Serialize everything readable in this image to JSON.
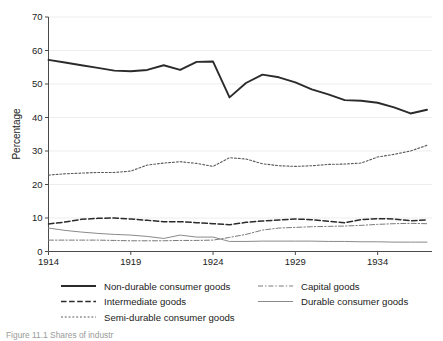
{
  "chart_data": {
    "type": "line",
    "title": "",
    "xlabel": "",
    "ylabel": "Percentage",
    "xlim": [
      1914,
      1937
    ],
    "ylim": [
      0,
      70
    ],
    "ytick_step": 10,
    "yticks": [
      0,
      10,
      20,
      30,
      40,
      50,
      60,
      70
    ],
    "xticks": [
      1914,
      1919,
      1924,
      1929,
      1934
    ],
    "grid": "horizontal",
    "legend_position": "below-plot",
    "x": [
      1914,
      1915,
      1916,
      1917,
      1918,
      1919,
      1920,
      1921,
      1922,
      1923,
      1924,
      1925,
      1926,
      1927,
      1928,
      1929,
      1930,
      1931,
      1932,
      1933,
      1934,
      1935,
      1936,
      1937
    ],
    "series": [
      {
        "name": "Non-durable consumer goods",
        "style": "solid",
        "width": 1.9,
        "color": "#2b2b2b",
        "values": [
          57.2,
          56.4,
          55.6,
          54.8,
          54.0,
          53.8,
          54.2,
          55.6,
          54.2,
          56.6,
          56.7,
          46.0,
          50.3,
          52.8,
          52.0,
          50.5,
          48.4,
          46.9,
          45.2,
          45.0,
          44.4,
          43.0,
          41.2,
          42.3
        ]
      },
      {
        "name": "Semi-durable consumer goods",
        "style": "dotted",
        "width": 1.1,
        "color": "#5a5a5a",
        "values": [
          22.8,
          23.2,
          23.4,
          23.6,
          23.6,
          24.0,
          25.8,
          26.4,
          26.8,
          26.3,
          25.4,
          28.0,
          27.6,
          26.2,
          25.6,
          25.4,
          25.6,
          26.0,
          26.1,
          26.4,
          28.2,
          29.0,
          30.0,
          31.7
        ]
      },
      {
        "name": "Intermediate goods",
        "style": "dashed",
        "width": 1.5,
        "color": "#2b2b2b",
        "values": [
          8.2,
          8.8,
          9.6,
          9.9,
          10.0,
          9.7,
          9.3,
          8.9,
          8.9,
          8.6,
          8.3,
          8.0,
          8.7,
          9.1,
          9.4,
          9.7,
          9.5,
          9.0,
          8.6,
          9.5,
          9.8,
          9.7,
          9.2,
          9.4
        ]
      },
      {
        "name": "Durable consumer goods",
        "style": "solid",
        "width": 1.0,
        "color": "#8a8a8a",
        "values": [
          7.0,
          6.3,
          5.8,
          5.4,
          5.1,
          4.9,
          4.5,
          3.9,
          4.9,
          4.3,
          4.3,
          3.0,
          3.0,
          3.1,
          3.1,
          3.1,
          3.1,
          3.0,
          3.0,
          2.9,
          2.9,
          2.8,
          2.8,
          2.8
        ]
      },
      {
        "name": "Capital goods",
        "style": "dashdot",
        "width": 1.0,
        "color": "#7a7a7a",
        "values": [
          3.4,
          3.4,
          3.4,
          3.4,
          3.3,
          3.2,
          3.2,
          3.2,
          3.3,
          3.3,
          3.4,
          4.2,
          5.1,
          6.4,
          7.0,
          7.2,
          7.4,
          7.5,
          7.6,
          7.8,
          8.1,
          8.3,
          8.4,
          8.3
        ]
      }
    ]
  },
  "axis": {
    "y_title": "Percentage",
    "y_tick_labels": [
      "0",
      "10",
      "20",
      "30",
      "40",
      "50",
      "60",
      "70"
    ],
    "x_tick_labels": [
      "1914",
      "1919",
      "1924",
      "1929",
      "1934"
    ]
  },
  "legend": {
    "column_left": [
      {
        "label": "Non-durable consumer goods",
        "style": "solid-thick"
      },
      {
        "label": "Intermediate goods",
        "style": "dashed"
      },
      {
        "label": "Semi-durable consumer goods",
        "style": "dotted"
      }
    ],
    "column_right": [
      {
        "label": "Capital goods",
        "style": "dashdot"
      },
      {
        "label": "Durable consumer goods",
        "style": "solid-thin"
      }
    ]
  },
  "caption": {
    "text": "Figure  11.1  Shares of industr"
  }
}
